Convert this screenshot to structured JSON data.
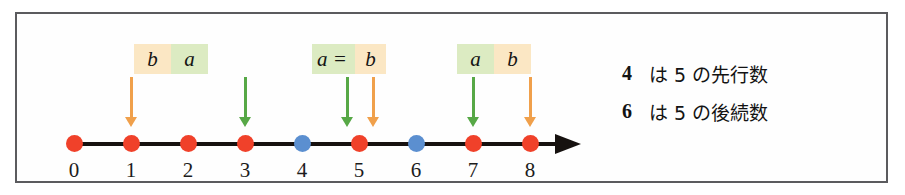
{
  "figure": {
    "type": "number-line-diagram",
    "frame_color": "#5b5b5e",
    "background": "#ffffff"
  },
  "number_line": {
    "ticks": [
      {
        "label": "0",
        "value": 0,
        "dot_color": "red"
      },
      {
        "label": "1",
        "value": 1,
        "dot_color": "red"
      },
      {
        "label": "2",
        "value": 2,
        "dot_color": "red"
      },
      {
        "label": "3",
        "value": 3,
        "dot_color": "red"
      },
      {
        "label": "4",
        "value": 4,
        "dot_color": "blue"
      },
      {
        "label": "5",
        "value": 5,
        "dot_color": "red"
      },
      {
        "label": "6",
        "value": 6,
        "dot_color": "blue"
      },
      {
        "label": "7",
        "value": 7,
        "dot_color": "red"
      },
      {
        "label": "8",
        "value": 8,
        "dot_color": "red"
      }
    ],
    "colors": {
      "red_dot": "#f0412a",
      "blue_dot": "#5b8fd0",
      "line": "#16110f"
    },
    "has_right_arrowhead": true
  },
  "annotations": {
    "arrows": [
      {
        "target_value": 1,
        "color_name": "orange",
        "color": "#f0a04b",
        "variable": "b"
      },
      {
        "target_value": 3,
        "color_name": "green",
        "color": "#57a846",
        "variable": "a"
      },
      {
        "target_value": 5,
        "color_name": "green",
        "color": "#57a846",
        "variable": "a"
      },
      {
        "target_value": 5,
        "color_name": "orange",
        "color": "#f0a04b",
        "variable": "b"
      },
      {
        "target_value": 7,
        "color_name": "green",
        "color": "#57a846",
        "variable": "a"
      },
      {
        "target_value": 8,
        "color_name": "orange",
        "color": "#f0a04b",
        "variable": "b"
      }
    ],
    "boxes": [
      {
        "id": "box-b-a",
        "cells": [
          {
            "text": "b",
            "background": "#fbe7c4"
          },
          {
            "text": "a",
            "background": "#dcebc2"
          }
        ]
      },
      {
        "id": "box-a-eq-b",
        "cells": [
          {
            "text": "a =",
            "background": "#dcebc2"
          },
          {
            "text": "b",
            "background": "#fbe7c4"
          }
        ]
      },
      {
        "id": "box-a-b",
        "cells": [
          {
            "text": "a",
            "background": "#dcebc2"
          },
          {
            "text": "b",
            "background": "#fbe7c4"
          }
        ]
      }
    ]
  },
  "legend": {
    "highlight_color": "#dceaf5",
    "rows": [
      {
        "number": "4",
        "text": "は 5 の先行数"
      },
      {
        "number": "6",
        "text": "は 5 の後続数"
      }
    ]
  }
}
